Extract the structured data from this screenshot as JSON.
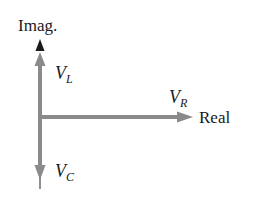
{
  "diagram": {
    "type": "phasor-diagram",
    "axes": {
      "vertical_label": "Imag.",
      "horizontal_label": "Real"
    },
    "phasors": [
      {
        "name": "V",
        "subscript": "L",
        "direction": "up"
      },
      {
        "name": "V",
        "subscript": "R",
        "direction": "right"
      },
      {
        "name": "V",
        "subscript": "C",
        "direction": "down"
      }
    ],
    "colors": {
      "phasor": "#8a8a8a",
      "axis_arrow": "#1a1a1a",
      "text": "#1a1a1a",
      "background": "#ffffff"
    }
  }
}
